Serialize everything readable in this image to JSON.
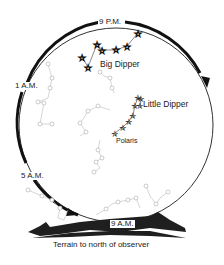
{
  "diagram": {
    "title": "",
    "time_labels": {
      "t9pm": "9 P.M.",
      "t1am": "1 A.M.",
      "t5am": "5 A.M.",
      "t9am": "9 A.M."
    },
    "constellation_labels": {
      "big_dipper": "Big Dipper",
      "little_dipper": "Little Dipper",
      "polaris": "Polaris"
    },
    "terrain_label": "Terrain to north of observer",
    "colors": {
      "ink": "#1a1a1a",
      "faint": "#b0b0b0",
      "terrain": "#1f1f1f",
      "background": "#ffffff"
    }
  }
}
